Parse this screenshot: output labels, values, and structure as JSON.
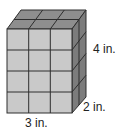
{
  "figure": {
    "type": "rectangular-prism-unit-cubes",
    "dimensions": {
      "length": 3,
      "width": 2,
      "height": 4,
      "unit": "in."
    },
    "labels": {
      "height": "4 in.",
      "width": "2 in.",
      "length": "3 in."
    },
    "colors": {
      "front_face": "#c9c9c9",
      "top_face": "#8e8e8e",
      "side_face": "#7c7c7c",
      "grid_lines": "#2e2e2e"
    }
  }
}
